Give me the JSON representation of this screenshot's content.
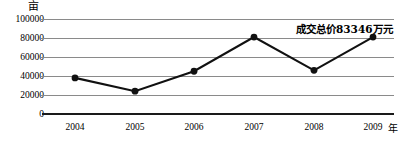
{
  "chart_data": {
    "type": "line",
    "title": "",
    "xlabel": "年",
    "ylabel": "亩",
    "categories": [
      "2004",
      "2005",
      "2006",
      "2007",
      "2008",
      "2009"
    ],
    "values": [
      38000,
      24000,
      45000,
      81000,
      46000,
      81000
    ],
    "series": [
      {
        "name": "土地成交面积",
        "values": [
          38000,
          24000,
          45000,
          81000,
          46000,
          81000
        ]
      }
    ],
    "ylim": [
      0,
      100000
    ],
    "yticks": [
      0,
      20000,
      40000,
      60000,
      80000,
      100000
    ],
    "ytick_labels": [
      "0",
      "20000",
      "40000",
      "60000",
      "80000",
      "100000"
    ],
    "grid": true,
    "legend": "none",
    "annotations": [
      {
        "text": "成交总价83346万元",
        "attached_to": "2009",
        "value": 83346,
        "unit": "万元"
      }
    ],
    "marker": "filled-circle",
    "line_color": "#111111",
    "grid_color": "#8a8a8a",
    "axis_color": "#1a1a1a"
  },
  "axis": {
    "y_unit": "亩",
    "x_unit": "年"
  }
}
